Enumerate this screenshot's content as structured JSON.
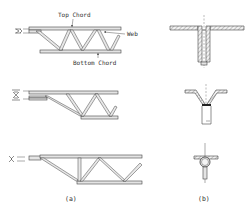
{
  "figure": {
    "labels": {
      "top_chord": "Top Chord",
      "web": "Web",
      "bottom_chord": "Bottom Chord"
    },
    "captions": {
      "a": "(a)",
      "b": "(b)"
    },
    "panels": [
      {
        "id": "a",
        "description": "Three open-web steel joist end configurations (side elevations), each with a top chord, a web of diagonal bars and a bottom chord"
      },
      {
        "id": "b",
        "description": "Three corresponding cross-section details of the joist chord/web connection"
      }
    ]
  }
}
